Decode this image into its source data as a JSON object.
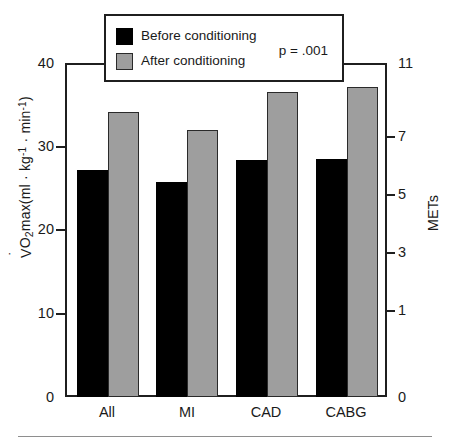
{
  "chart_data": {
    "type": "bar",
    "title": "",
    "subtitle": "",
    "categories": [
      "All",
      "MI",
      "CAD",
      "CABG"
    ],
    "series": [
      {
        "name": "Before conditioning",
        "color": "#000000",
        "values": [
          27.3,
          25.8,
          28.5,
          28.6
        ]
      },
      {
        "name": "After conditioning",
        "color": "#9e9e9e",
        "values": [
          34.2,
          32.1,
          36.7,
          37.2
        ]
      }
    ],
    "xlabel": "",
    "ylabel": "VO2max(ml · kg⁻¹ · min⁻¹)",
    "ylim": [
      0,
      40
    ],
    "yticks": [
      0,
      10,
      20,
      30,
      40
    ],
    "secondary_axis": {
      "label": "METs",
      "lim": [
        0,
        11.43
      ],
      "ticks": [
        0,
        1,
        3,
        5,
        7,
        11
      ],
      "ticklabels": [
        "0",
        "1",
        "3",
        "5",
        "7",
        "11"
      ]
    },
    "grid": false,
    "legend_position": "top-center",
    "annotations": [
      "p = .001"
    ]
  },
  "axes": {
    "left": {
      "title_prefix": "V",
      "title_sub": "O",
      "title_sub2": "2",
      "title_mid": "max(ml · kg",
      "title_sup1": "-1",
      "title_mid2": " · min",
      "title_sup2": "-1",
      "title_close": ")",
      "ticklabels": [
        "40",
        "30",
        "20",
        "10",
        "0"
      ]
    },
    "right": {
      "title": "METs",
      "ticklabels": [
        "11",
        "7",
        "5",
        "3",
        "1",
        "0"
      ]
    }
  },
  "legend": {
    "items": [
      {
        "label": "Before conditioning",
        "swatch": "black-swatch"
      },
      {
        "label": "After conditioning",
        "swatch": "gray-swatch"
      }
    ],
    "pvalue": "p =  .001"
  },
  "xlabels": [
    "All",
    "MI",
    "CAD",
    "CABG"
  ]
}
